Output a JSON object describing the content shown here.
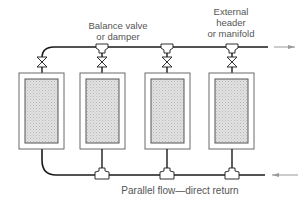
{
  "diagram": {
    "caption": "Parallel flow—direct return",
    "labels": {
      "balance_valve_line1": "Balance valve",
      "balance_valve_line2": "or damper",
      "header_line1": "External",
      "header_line2": "header",
      "header_line3": "or manifold"
    },
    "units": [
      {
        "id": 1,
        "name": "unit-1"
      },
      {
        "id": 2,
        "name": "unit-2"
      },
      {
        "id": 3,
        "name": "unit-3"
      },
      {
        "id": 4,
        "name": "unit-4"
      }
    ],
    "flow": {
      "supply_direction": "out-right",
      "return_direction": "in-from-right"
    },
    "colors": {
      "line": "#1a1a1a",
      "box_outline": "#6a6a6a",
      "fill": "#d8d8d8",
      "text": "#555555",
      "arrow": "#888888"
    }
  }
}
